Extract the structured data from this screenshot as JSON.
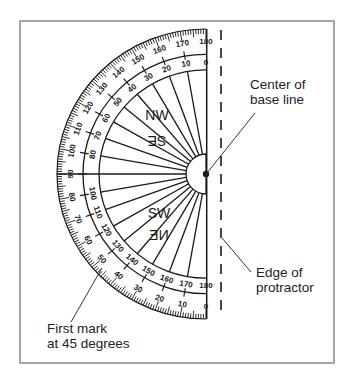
{
  "figure": {
    "frame": {
      "x": 20,
      "y": 21,
      "w": 314,
      "h": 342,
      "stroke": "#8a8a8a"
    },
    "ink_color": "#1a1a1a",
    "protractor": {
      "center": {
        "x": 206,
        "y": 174
      },
      "outer_radius_x": 149,
      "outer_radius_y": 145,
      "outer_scale_radius": 123,
      "inner_scale_radius": 107,
      "hub_radius": 20,
      "spoke_step_deg": 10,
      "outer_scale_top": [
        "180",
        "170",
        "160",
        "150",
        "140",
        "130",
        "120",
        "110",
        "100",
        "90"
      ],
      "inner_scale_top": [
        "0",
        "10",
        "20",
        "30",
        "40",
        "50",
        "60",
        "70",
        "80"
      ],
      "outer_scale_bottom": [
        "80",
        "70",
        "60",
        "50",
        "40",
        "30",
        "20",
        "10",
        "0"
      ],
      "inner_scale_bottom": [
        "100",
        "110",
        "120",
        "130",
        "140",
        "150",
        "160",
        "170",
        "180"
      ],
      "compass_top": [
        "NW",
        "SE"
      ],
      "compass_bottom": [
        "SW",
        "NE"
      ]
    },
    "edge_line": {
      "x": 221,
      "y1": 30,
      "y2": 316,
      "dash": "10 8"
    },
    "annotations": [
      {
        "id": "center",
        "lines": [
          "Center of",
          "base line"
        ],
        "text_x": 250,
        "text_y": 89,
        "leader": [
          255,
          113,
          207,
          173
        ]
      },
      {
        "id": "edge",
        "lines": [
          "Edge of",
          "protractor"
        ],
        "text_x": 256,
        "text_y": 277,
        "leader": [
          222,
          238,
          251,
          272
        ]
      },
      {
        "id": "first-mark",
        "lines": [
          "First mark",
          "at 45 degrees"
        ],
        "text_x": 47,
        "text_y": 333,
        "leader": [
          71,
          322,
          102,
          268
        ]
      }
    ]
  }
}
